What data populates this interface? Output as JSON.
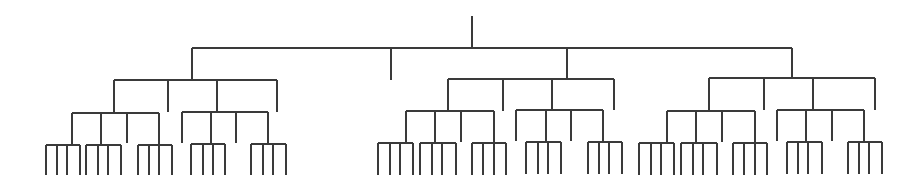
{
  "diagram": {
    "type": "tree",
    "width": 923,
    "height": 182,
    "line_color": "#3a3a3a",
    "root": {
      "x": 472,
      "y_top": 16,
      "y_bar": 48,
      "children_x": [
        192,
        391,
        567,
        792
      ],
      "stub_children": [
        {
          "x": 391,
          "y_end": 80
        }
      ]
    },
    "subtrees": [
      {
        "name": "left",
        "x": 192,
        "y_top": 48,
        "y_bar": 80,
        "children_x": [
          114,
          168,
          217,
          277
        ],
        "stubs": [
          {
            "x": 168,
            "y_end": 112
          },
          {
            "x": 277,
            "y_end": 112
          }
        ],
        "branches": [
          {
            "x": 114,
            "y_bar": 113,
            "children_x": [
              72,
              101,
              127,
              159
            ],
            "stubs": [
              {
                "x": 127,
                "y_end": 143
              }
            ],
            "leaf_groups": [
              {
                "parent_x": 72,
                "y_bar": 145,
                "leaves_x": [
                  46,
                  57,
                  67,
                  80
                ],
                "y_end": 175
              },
              {
                "parent_x": 101,
                "y_bar": 145,
                "leaves_x": [
                  86,
                  98,
                  108,
                  121
                ],
                "y_end": 175
              },
              {
                "parent_x": 159,
                "y_bar": 145,
                "leaves_x": [
                  138,
                  149,
                  159,
                  172
                ],
                "y_end": 175
              }
            ]
          },
          {
            "x": 217,
            "y_bar": 112,
            "children_x": [
              182,
              211,
              236,
              268
            ],
            "stubs": [
              {
                "x": 182,
                "y_end": 143
              },
              {
                "x": 236,
                "y_end": 143
              }
            ],
            "leaf_groups": [
              {
                "parent_x": 211,
                "y_bar": 144,
                "leaves_x": [
                  191,
                  203,
                  213,
                  225
                ],
                "y_end": 175
              },
              {
                "parent_x": 268,
                "y_bar": 144,
                "leaves_x": [
                  251,
                  263,
                  273,
                  286
                ],
                "y_end": 175
              }
            ]
          }
        ]
      },
      {
        "name": "middle",
        "x": 567,
        "y_top": 48,
        "y_bar": 79,
        "children_x": [
          448,
          503,
          552,
          614
        ],
        "stubs": [
          {
            "x": 503,
            "y_end": 111
          },
          {
            "x": 614,
            "y_end": 110
          }
        ],
        "branches": [
          {
            "x": 448,
            "y_bar": 111,
            "children_x": [
              406,
              435,
              461,
              494
            ],
            "stubs": [
              {
                "x": 461,
                "y_end": 142
              }
            ],
            "leaf_groups": [
              {
                "parent_x": 406,
                "y_bar": 143,
                "leaves_x": [
                  378,
                  390,
                  400,
                  413
                ],
                "y_end": 175
              },
              {
                "parent_x": 435,
                "y_bar": 143,
                "leaves_x": [
                  420,
                  432,
                  442,
                  456
                ],
                "y_end": 175
              },
              {
                "parent_x": 494,
                "y_bar": 143,
                "leaves_x": [
                  472,
                  483,
                  494,
                  506
                ],
                "y_end": 175
              }
            ]
          },
          {
            "x": 552,
            "y_bar": 110,
            "children_x": [
              516,
              546,
              571,
              603
            ],
            "stubs": [
              {
                "x": 516,
                "y_end": 141
              },
              {
                "x": 571,
                "y_end": 141
              }
            ],
            "leaf_groups": [
              {
                "parent_x": 546,
                "y_bar": 142,
                "leaves_x": [
                  526,
                  538,
                  548,
                  561
                ],
                "y_end": 174
              },
              {
                "parent_x": 603,
                "y_bar": 142,
                "leaves_x": [
                  588,
                  599,
                  609,
                  622
                ],
                "y_end": 174
              }
            ]
          }
        ]
      },
      {
        "name": "right",
        "x": 792,
        "y_top": 48,
        "y_bar": 78,
        "children_x": [
          709,
          764,
          813,
          875
        ],
        "stubs": [
          {
            "x": 764,
            "y_end": 110
          },
          {
            "x": 875,
            "y_end": 110
          }
        ],
        "branches": [
          {
            "x": 709,
            "y_bar": 111,
            "children_x": [
              667,
              696,
              722,
              755
            ],
            "stubs": [
              {
                "x": 722,
                "y_end": 142
              }
            ],
            "leaf_groups": [
              {
                "parent_x": 667,
                "y_bar": 143,
                "leaves_x": [
                  639,
                  651,
                  661,
                  674
                ],
                "y_end": 175
              },
              {
                "parent_x": 696,
                "y_bar": 143,
                "leaves_x": [
                  681,
                  693,
                  703,
                  717
                ],
                "y_end": 175
              },
              {
                "parent_x": 755,
                "y_bar": 143,
                "leaves_x": [
                  733,
                  744,
                  755,
                  767
                ],
                "y_end": 175
              }
            ]
          },
          {
            "x": 813,
            "y_bar": 110,
            "children_x": [
              777,
              806,
              832,
              864
            ],
            "stubs": [
              {
                "x": 777,
                "y_end": 141
              },
              {
                "x": 832,
                "y_end": 141
              }
            ],
            "leaf_groups": [
              {
                "parent_x": 806,
                "y_bar": 142,
                "leaves_x": [
                  787,
                  798,
                  808,
                  822
                ],
                "y_end": 174
              },
              {
                "parent_x": 864,
                "y_bar": 142,
                "leaves_x": [
                  848,
                  859,
                  869,
                  882
                ],
                "y_end": 174
              }
            ]
          }
        ]
      }
    ]
  }
}
